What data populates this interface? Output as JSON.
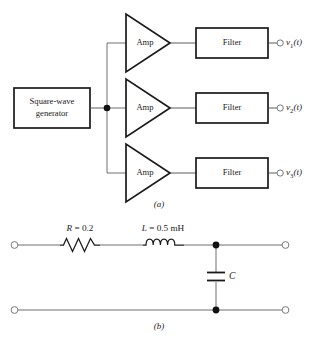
{
  "figure": {
    "panel_a": {
      "caption": "(a)",
      "source_block": {
        "line1": "Square-wave",
        "line2": "generator"
      },
      "junction_dot": "node",
      "channels": [
        {
          "amp_label": "Amp",
          "filter_label": "Filter",
          "output_label_main": "v",
          "output_label_sub": "1",
          "output_label_arg": "(t)",
          "output_terminal": "open-circle"
        },
        {
          "amp_label": "Amp",
          "filter_label": "Filter",
          "output_label_main": "v",
          "output_label_sub": "2",
          "output_label_arg": "(t)",
          "output_terminal": "open-circle"
        },
        {
          "amp_label": "Amp",
          "filter_label": "Filter",
          "output_label_main": "v",
          "output_label_sub": "3",
          "output_label_arg": "(t)",
          "output_terminal": "open-circle"
        }
      ]
    },
    "panel_b": {
      "caption": "(b)",
      "resistor": {
        "symbol_var": "R",
        "equals": " = ",
        "value": "0.2"
      },
      "inductor": {
        "symbol_var": "L",
        "equals": " = ",
        "value": "0.5 mH"
      },
      "capacitor": {
        "symbol_var": "C"
      },
      "terminals": {
        "top_left": "open-circle",
        "top_right": "open-circle",
        "bottom_left": "open-circle",
        "bottom_right": "open-circle"
      },
      "nodes": {
        "top": "filled-dot",
        "bottom": "filled-dot"
      }
    }
  },
  "colors": {
    "background": "#ffffff",
    "ink": "#1a1a1a",
    "wire": "#4a4a4a",
    "node": "#111111"
  }
}
